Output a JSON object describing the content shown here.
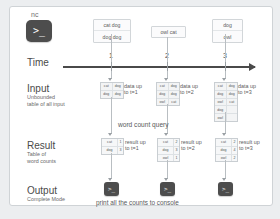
{
  "diagram": {
    "source": {
      "label": "nc",
      "icon": "terminal-icon",
      "prompt": ">_"
    },
    "messages": [
      {
        "lines": [
          "cat dog",
          "dog dog"
        ]
      },
      {
        "lines": [
          "owl cat"
        ]
      },
      {
        "lines": [
          "dog",
          "owl"
        ]
      }
    ],
    "timeline": {
      "label": "Time",
      "ticks": [
        "1",
        "2",
        "3"
      ]
    },
    "input_row": {
      "title": "Input",
      "subtitle_line1": "Unbounded",
      "subtitle_line2": "table of all input",
      "snapshots": [
        {
          "caption_line1": "data up",
          "caption_line2": "to t=1",
          "rows": [
            [
              "cat",
              "dog"
            ],
            [
              "dog",
              "dog"
            ]
          ]
        },
        {
          "caption_line1": "data up",
          "caption_line2": "to t=2",
          "rows": [
            [
              "cat",
              "dog"
            ],
            [
              "dog",
              "dog"
            ],
            [
              "owl",
              "cat"
            ]
          ]
        },
        {
          "caption_line1": "data up",
          "caption_line2": "to t=3",
          "rows": [
            [
              "cat",
              "dog"
            ],
            [
              "dog",
              "dog"
            ],
            [
              "owl",
              "cat"
            ],
            [
              "dog",
              ""
            ],
            [
              "owl",
              ""
            ]
          ]
        }
      ]
    },
    "query_label": "word count query",
    "result_row": {
      "title": "Result",
      "subtitle_line1": "Table of",
      "subtitle_line2": "word counts",
      "snapshots": [
        {
          "caption_line1": "result up",
          "caption_line2": "to t=1",
          "rows": [
            [
              "cat",
              "1"
            ],
            [
              "dog",
              "3"
            ]
          ]
        },
        {
          "caption_line1": "result up",
          "caption_line2": "to t=2",
          "rows": [
            [
              "cat",
              "2"
            ],
            [
              "dog",
              "3"
            ],
            [
              "owl",
              "1"
            ]
          ]
        },
        {
          "caption_line1": "result up",
          "caption_line2": "to t=3",
          "rows": [
            [
              "cat",
              "2"
            ],
            [
              "dog",
              "4"
            ],
            [
              "owl",
              "2"
            ]
          ]
        }
      ]
    },
    "output_row": {
      "title": "Output",
      "subtitle_line1": "Complete Mode",
      "console_label": "print all the counts to console",
      "terminals": [
        {
          "icon": "terminal-icon",
          "prompt": ">_"
        },
        {
          "icon": "terminal-icon",
          "prompt": ">_"
        },
        {
          "icon": "terminal-icon",
          "prompt": ">_"
        }
      ]
    },
    "colors": {
      "page_background": "#eceef0",
      "panel_background": "#ffffff",
      "panel_border": "#cfd3d6",
      "terminal": "#4d4d4d",
      "axis": "#4a4a4a",
      "connector": "#b9bec2",
      "text": "#58595b"
    }
  }
}
